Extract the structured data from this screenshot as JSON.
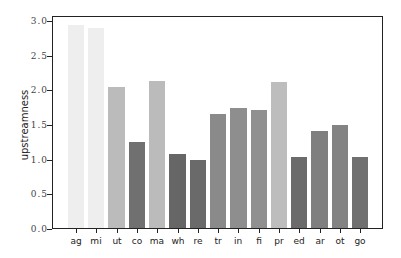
{
  "chart_data": {
    "type": "bar",
    "title": "",
    "xlabel": "",
    "ylabel": "upstreamness",
    "categories": [
      "ag",
      "mi",
      "ut",
      "co",
      "ma",
      "wh",
      "re",
      "tr",
      "in",
      "fi",
      "pr",
      "ed",
      "ar",
      "ot",
      "go"
    ],
    "values": [
      2.93,
      2.89,
      2.03,
      1.24,
      2.12,
      1.07,
      0.98,
      1.65,
      1.73,
      1.7,
      2.1,
      1.02,
      1.4,
      1.49,
      1.02
    ],
    "colors": [
      "#eeeeee",
      "#eeeeee",
      "#bbbbbb",
      "#707070",
      "#bbbbbb",
      "#666666",
      "#6a6a6a",
      "#8a8a8a",
      "#8e8e8e",
      "#909090",
      "#bdbdbd",
      "#6b6b6b",
      "#7f7f7f",
      "#838383",
      "#707070"
    ],
    "yticks": [
      0.0,
      0.5,
      1.0,
      1.5,
      2.0,
      2.5,
      3.0
    ],
    "ytick_labels": [
      "0.0",
      "0.5",
      "1.0",
      "1.5",
      "2.0",
      "2.5",
      "3.0"
    ],
    "ylim": [
      0,
      3.07
    ],
    "grid": false,
    "legend": null
  }
}
